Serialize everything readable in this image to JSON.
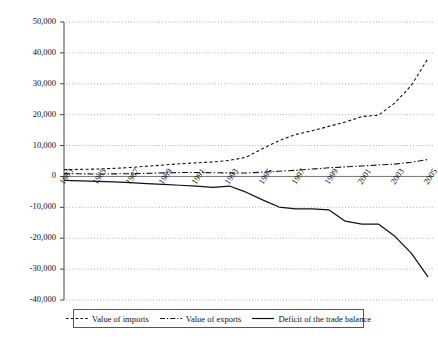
{
  "chart_data": {
    "type": "line",
    "title": "",
    "subtitle": "",
    "xlabel": "",
    "ylabel": "",
    "grid": true,
    "legend_position": "bottom",
    "ylim": [
      -40000,
      50000
    ],
    "yticks": [
      50000,
      40000,
      30000,
      20000,
      10000,
      0,
      -10000,
      -20000,
      -30000,
      -40000
    ],
    "ytick_labels": [
      "50,000",
      "40,000",
      "30,000",
      "20,000",
      "10,000",
      "0",
      "-10,000",
      "-20,000",
      "-30,000",
      "-40,000"
    ],
    "x": [
      1983,
      1984,
      1985,
      1986,
      1987,
      1988,
      1989,
      1990,
      1991,
      1992,
      1993,
      1994,
      1995,
      1996,
      1997,
      1998,
      1999,
      2000,
      2001,
      2002,
      2003,
      2004,
      2005
    ],
    "xtick_labels": [
      "1983",
      "1985",
      "1987",
      "1989",
      "1991",
      "1993",
      "1995",
      "1997",
      "1999",
      "2001",
      "2003",
      "2005"
    ],
    "xticks": [
      1983,
      1985,
      1987,
      1989,
      1991,
      1993,
      1995,
      1997,
      1999,
      2001,
      2003,
      2005
    ],
    "series": [
      {
        "name": "Value of imports",
        "style": "dashed",
        "values": [
          2200,
          2300,
          2400,
          2600,
          2900,
          3300,
          3700,
          4100,
          4400,
          4700,
          5200,
          6200,
          9000,
          11600,
          13600,
          14800,
          16200,
          17600,
          19400,
          19800,
          23800,
          29500,
          38200
        ]
      },
      {
        "name": "Value of exports",
        "style": "dash-dot",
        "values": [
          900,
          850,
          800,
          820,
          900,
          1000,
          1150,
          1250,
          1300,
          1200,
          1150,
          1100,
          1400,
          1700,
          2000,
          2400,
          2800,
          3100,
          3400,
          3700,
          4000,
          4600,
          5500
        ]
      },
      {
        "name": "Deficit of the trade balance",
        "style": "solid",
        "values": [
          -1300,
          -1450,
          -1600,
          -1780,
          -1990,
          -2300,
          -2550,
          -2850,
          -3100,
          -3500,
          -3100,
          -5100,
          -7600,
          -9900,
          -10500,
          -10500,
          -10800,
          -14500,
          -15400,
          -15400,
          -19400,
          -24900,
          -32500
        ]
      }
    ]
  },
  "legend": {
    "items": [
      {
        "label": "Value of imports",
        "swatch": "dashed-line-swatch"
      },
      {
        "label": "Value of exports",
        "swatch": "dash-dot-line-swatch"
      },
      {
        "label": "Deficit of the trade balance",
        "swatch": "solid-line-swatch"
      }
    ]
  }
}
